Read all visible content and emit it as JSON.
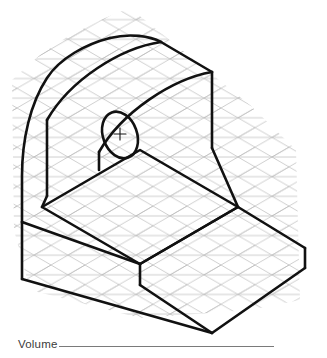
{
  "sheet": {
    "background_color": "#ffffff",
    "width": 327,
    "height": 358
  },
  "grid": {
    "name": "isometric-dot-grid",
    "color": "#b9b9b9",
    "line_width": 0.7,
    "spacing_px": 17,
    "angle_degrees": 30,
    "description": "Light gray isometric triangular grid (three line families at 0, +30 and -30 degrees) filling the drawing field behind the object."
  },
  "drawing": {
    "title": "isometric-pictorial-of-machined-block",
    "line_color": "#111111",
    "object_line_width": 2.6,
    "features": [
      "rounded-top vertical back plate",
      "through hole in vertical plate",
      "horizontal base slab",
      "angled side face"
    ]
  },
  "geometry": {
    "outline_points": "161,42 161,120 212,148 238,207 305,248 305,268 212,333 22,279 22,222",
    "top_apex": "161,42",
    "right_vertex": "305,248",
    "bottom_front_vertex": "212,333",
    "left_bottom_vertex": "22,222",
    "hole_center": "120,135",
    "hole_rx": 17,
    "hole_ry": 24,
    "hole_rotation_degrees": -20
  },
  "prompt": {
    "label": "Volume",
    "blank_value": "",
    "blank_color": "#7a7a7a"
  }
}
